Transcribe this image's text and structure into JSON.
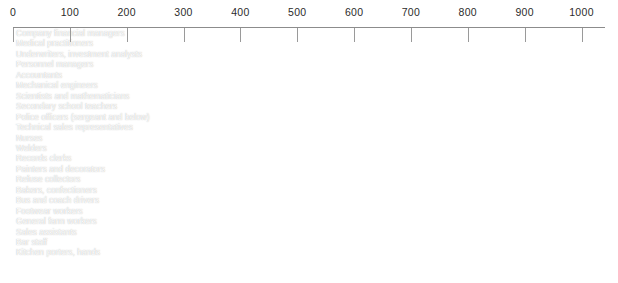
{
  "chart_data": {
    "type": "bar",
    "orientation": "horizontal",
    "title": "",
    "subtitle": "",
    "xlabel": "",
    "ylabel": "",
    "xlim": [
      0,
      1030
    ],
    "grid": false,
    "legend": null,
    "axis_position": "top",
    "tick_labels": [
      "0",
      "100",
      "200",
      "300",
      "400",
      "500",
      "600",
      "700",
      "800",
      "900",
      "1000"
    ],
    "tick_values": [
      0,
      100,
      200,
      300,
      400,
      500,
      600,
      700,
      800,
      900,
      1000
    ],
    "bar_color": "#9a9a9a",
    "label_color": "#ffffff",
    "axis_color": "#8c8c8c",
    "categories": [
      "Company financial managers",
      "Medical practitioners",
      "Underwriters, investment analysts",
      "Personnel managers",
      "Accountants",
      "Mechanical engineers",
      "Scientists and mathematicians",
      "Secondary school teachers",
      "Police officers (sergeant and below)",
      "Technical sales representatives",
      "Nurses",
      "Welders",
      "Records clerks",
      "Painters and decorators",
      "Refuse collectors",
      "Bakers, confectioners",
      "Bus and coach drivers",
      "Footwear workers",
      "General farm workers",
      "Sales assistants",
      "Bar staff",
      "Kitchen porters, hands"
    ],
    "values": [
      1010,
      940,
      830,
      720,
      630,
      545,
      530,
      505,
      490,
      455,
      375,
      370,
      330,
      320,
      310,
      300,
      290,
      280,
      265,
      255,
      225,
      170
    ]
  }
}
